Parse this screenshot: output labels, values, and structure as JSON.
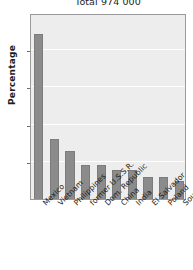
{
  "chart_data": {
    "type": "bar",
    "title": "Total 974 000",
    "xlabel": "",
    "ylabel": "Percentage",
    "ylim": [
      0,
      25
    ],
    "yticks": [
      0,
      5,
      10,
      15,
      20,
      25
    ],
    "grid": true,
    "legend": null,
    "categories": [
      "Mexico",
      "Vietnam",
      "Philippines",
      "former U.S.S.R.",
      "Dom. Republic",
      "China",
      "India",
      "El Salvador",
      "Poland",
      "South Korea"
    ],
    "values": [
      22.2,
      8.0,
      6.5,
      4.6,
      4.6,
      3.9,
      3.9,
      3.0,
      3.0,
      2.4
    ],
    "bar_color": "#8b8b8b",
    "plot_background": "#ededed",
    "gridline_color": "#ffffff",
    "axis_color": "#9a9a9a"
  }
}
